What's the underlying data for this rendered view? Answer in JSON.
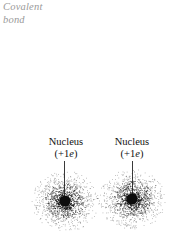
{
  "figure": {
    "title_annotation": {
      "line1": "Covalent",
      "line2": "bond",
      "color": "#9a9a9a",
      "style": "italic"
    },
    "atoms": [
      {
        "id": "left-atom",
        "label_line1": "Nucleus",
        "label_charge_prefix": "(+1",
        "label_charge_symbol": "e",
        "label_charge_suffix": ")",
        "charge_value": "+1e",
        "center_x": 65,
        "center_y": 201,
        "cloud_radius": 33,
        "core_radius": 6
      },
      {
        "id": "right-atom",
        "label_line1": "Nucleus",
        "label_charge_prefix": "(+1",
        "label_charge_symbol": "e",
        "label_charge_suffix": ")",
        "charge_value": "+1e",
        "center_x": 132,
        "center_y": 199,
        "cloud_radius": 33,
        "core_radius": 6
      }
    ],
    "colors": {
      "background": "#ffffff",
      "text": "#111111",
      "annotation": "#9a9a9a",
      "leader_line": "#3a3a3a",
      "stipple": "#1a1a1a",
      "core": "#0d0d0d"
    }
  }
}
